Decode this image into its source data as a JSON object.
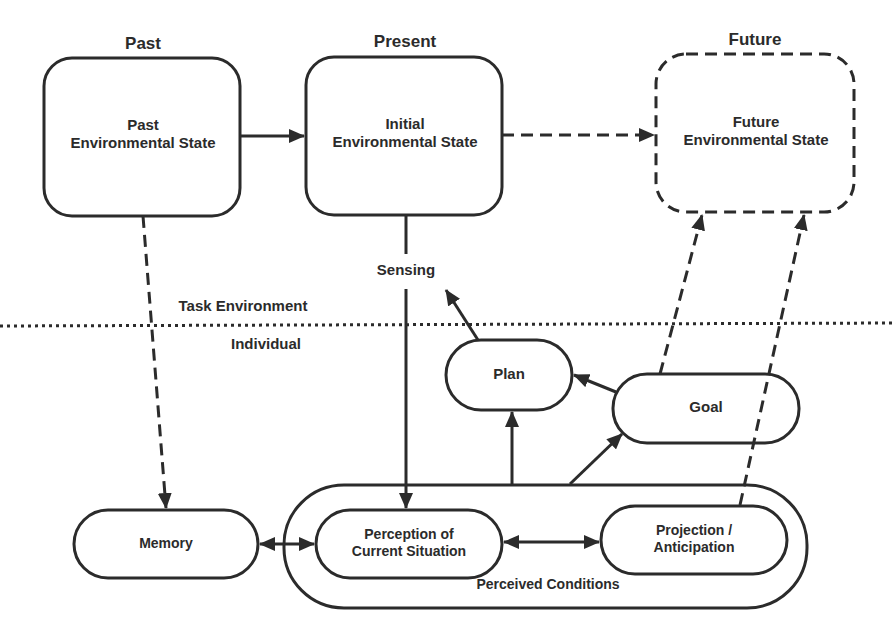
{
  "headers": {
    "past": "Past",
    "present": "Present",
    "future": "Future"
  },
  "boxes": {
    "past_state": [
      "Past",
      "Environmental State"
    ],
    "initial_state": [
      "Initial",
      "Environmental State"
    ],
    "future_state": [
      "Future",
      "Environmental State"
    ],
    "plan": "Plan",
    "goal": "Goal",
    "memory": "Memory",
    "perception": [
      "Perception of",
      "Current Situation"
    ],
    "projection": [
      "Projection /",
      "Anticipation"
    ],
    "perceived_conditions": "Perceived Conditions"
  },
  "labels": {
    "sensing": "Sensing",
    "task_environment": "Task Environment",
    "individual": "Individual"
  },
  "colors": {
    "stroke": "#2b2b2b",
    "background": "#ffffff"
  }
}
